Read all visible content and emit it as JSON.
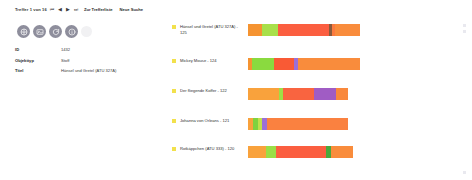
{
  "nav": {
    "count_text": "Treffer 1 von 16",
    "arrow_first": "⏮",
    "arrow_prev": "◀",
    "arrow_next": "▶",
    "arrow_last": "⏭",
    "link_list": "Zur Trefferliste",
    "link_new_search": "Neue Suche"
  },
  "toolbar": {
    "buttons": [
      {
        "icon": "share-icon"
      },
      {
        "icon": "image-icon"
      },
      {
        "icon": "refresh-icon"
      },
      {
        "icon": "info-icon"
      }
    ]
  },
  "metadata": {
    "rows": [
      {
        "label": "ID",
        "value": "1432"
      },
      {
        "label": "Objekttyp",
        "value": "Stoff"
      },
      {
        "label": "Titel",
        "value": "Hänsel und Gretel (ATU 327A)"
      }
    ]
  },
  "results": {
    "bullet_color": "#f2e14c",
    "items": [
      {
        "label": "Hänsel und Gretel (ATU 327A) - 125",
        "top": 24,
        "bar": {
          "x": 248,
          "segments": [
            {
              "color": "#f59331",
              "width": 14
            },
            {
              "color": "#a8e04a",
              "width": 16
            },
            {
              "color": "#fb5e40",
              "width": 51
            },
            {
              "color": "#8a5a3c",
              "width": 3
            },
            {
              "color": "#fb7a3e",
              "width": 3
            },
            {
              "color": "#f98c3c",
              "width": 25
            }
          ]
        }
      },
      {
        "label": "Mickey Mouse - 124",
        "top": 58,
        "bar": {
          "x": 248,
          "segments": [
            {
              "color": "#f59331",
              "width": 4
            },
            {
              "color": "#8ada3f",
              "width": 22
            },
            {
              "color": "#f95a35",
              "width": 20
            },
            {
              "color": "#9b6fd6",
              "width": 4
            },
            {
              "color": "#f98c3c",
              "width": 62
            }
          ]
        }
      },
      {
        "label": "Der fliegende Koffer - 122",
        "top": 88,
        "bar": {
          "x": 248,
          "segments": [
            {
              "color": "#f9a23c",
              "width": 31
            },
            {
              "color": "#9ede46",
              "width": 4
            },
            {
              "color": "#f96440",
              "width": 31
            },
            {
              "color": "#a05cc4",
              "width": 22
            },
            {
              "color": "#f9883c",
              "width": 12
            }
          ]
        }
      },
      {
        "label": "Johanna von Orleans - 121",
        "top": 118,
        "bar": {
          "x": 248,
          "segments": [
            {
              "color": "#f9a23c",
              "width": 5
            },
            {
              "color": "#7fd23f",
              "width": 5
            },
            {
              "color": "#c0e04a",
              "width": 4
            },
            {
              "color": "#9b6fd6",
              "width": 5
            },
            {
              "color": "#fa8140",
              "width": 81
            }
          ]
        }
      },
      {
        "label": "Rotkäppchen (ATU 333) - 120",
        "top": 146,
        "bar": {
          "x": 248,
          "segments": [
            {
              "color": "#f9a23c",
              "width": 18
            },
            {
              "color": "#9ade46",
              "width": 10
            },
            {
              "color": "#fb5e40",
              "width": 50
            },
            {
              "color": "#4aa83c",
              "width": 5
            },
            {
              "color": "#f98c3c",
              "width": 22
            }
          ]
        }
      }
    ]
  },
  "scroll_marks": [
    {
      "top": 24
    },
    {
      "top": 30
    },
    {
      "top": 171
    }
  ]
}
